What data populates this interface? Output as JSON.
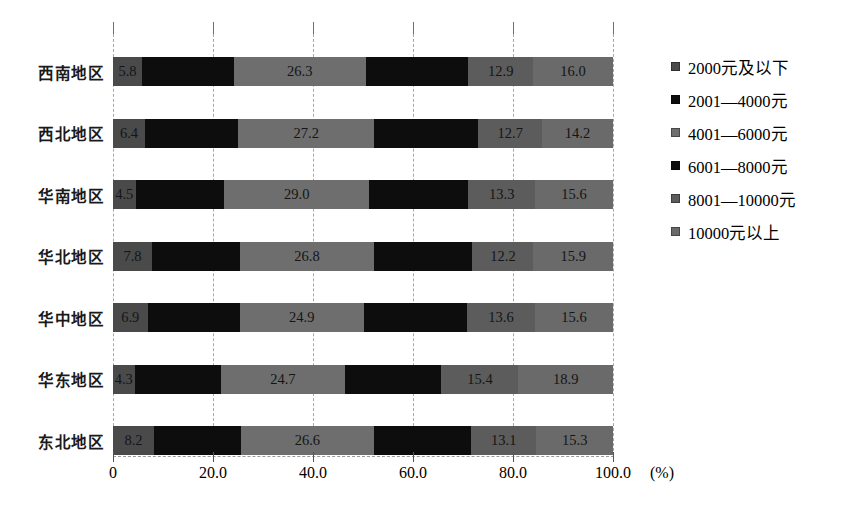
{
  "chart_data": {
    "type": "bar",
    "orientation": "horizontal",
    "stacked": true,
    "percent": true,
    "title": "",
    "xlabel": "(%)",
    "ylabel": "",
    "xlim": [
      0,
      100
    ],
    "xticks": [
      "0",
      "20.0",
      "40.0",
      "60.0",
      "80.0",
      "100.0"
    ],
    "xtick_values": [
      0,
      20,
      40,
      60,
      80,
      100
    ],
    "xunit": "(%)",
    "grid": true,
    "legend_position": "right",
    "categories": [
      "西南地区",
      "西北地区",
      "华南地区",
      "华北地区",
      "华中地区",
      "华东地区",
      "东北地区"
    ],
    "series": [
      {
        "name": "2000元及以下",
        "color": "#4a4a4a",
        "values": [
          5.8,
          6.4,
          4.5,
          7.8,
          6.9,
          4.3,
          8.2
        ]
      },
      {
        "name": "2001—4000元",
        "color": "#0d0d0d",
        "values": [
          null,
          null,
          null,
          null,
          null,
          null,
          null
        ]
      },
      {
        "name": "4001—6000元",
        "color": "#6e6e6e",
        "values": [
          26.3,
          27.2,
          29.0,
          26.8,
          24.9,
          24.7,
          26.6
        ]
      },
      {
        "name": "6001—8000元",
        "color": "#0d0d0d",
        "values": [
          null,
          null,
          null,
          null,
          null,
          null,
          null
        ]
      },
      {
        "name": "8001—10000元",
        "color": "#5c5c5c",
        "values": [
          12.9,
          12.7,
          13.3,
          12.2,
          13.6,
          15.4,
          13.1
        ]
      },
      {
        "name": "10000元以上",
        "color": "#6a6a6a",
        "values": [
          16.0,
          14.2,
          15.6,
          15.9,
          15.6,
          18.9,
          15.3
        ]
      }
    ],
    "labels_by_row": [
      [
        "5.8",
        "",
        "26.3",
        "",
        "12.9",
        "16.0"
      ],
      [
        "6.4",
        "",
        "27.2",
        "",
        "12.7",
        "14.2"
      ],
      [
        "4.5",
        "",
        "29.0",
        "",
        "13.3",
        "15.6"
      ],
      [
        "7.8",
        "",
        "26.8",
        "",
        "12.2",
        "15.9"
      ],
      [
        "6.9",
        "",
        "24.9",
        "",
        "13.6",
        "15.6"
      ],
      [
        "4.3",
        "",
        "24.7",
        "",
        "15.4",
        "18.9"
      ],
      [
        "8.2",
        "",
        "26.6",
        "",
        "13.1",
        "15.3"
      ]
    ],
    "legend": [
      "2000元及以下",
      "2001—4000元",
      "4001—6000元",
      "6001—8000元",
      "8001—10000元",
      "10000元以上"
    ],
    "colors": {
      "series_1": "#4a4a4a",
      "series_2": "#0d0d0d",
      "series_3": "#6e6e6e",
      "series_4": "#0d0d0d",
      "series_5": "#5c5c5c",
      "series_6": "#6a6a6a",
      "gridline": "#a8a8a8",
      "axis": "#555555",
      "text": "#000000",
      "background": "#ffffff"
    }
  }
}
